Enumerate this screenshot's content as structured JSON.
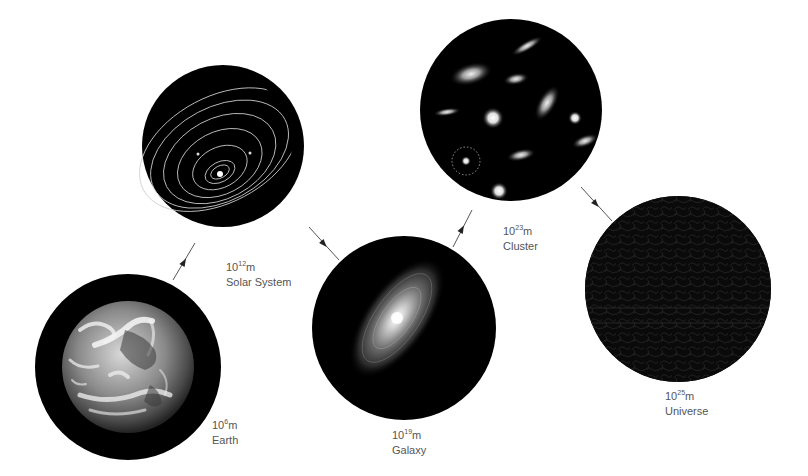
{
  "diagram": {
    "title": "",
    "stages": [
      {
        "id": "earth",
        "base": "10",
        "exponent": "6",
        "unit": "m",
        "name": "Earth",
        "cx": 128,
        "cy": 367,
        "r": 93,
        "label_x": 212,
        "label_y": 418
      },
      {
        "id": "solar-system",
        "base": "10",
        "exponent": "12",
        "unit": "m",
        "name": "Solar System",
        "cx": 223,
        "cy": 146,
        "r": 81,
        "label_x": 226,
        "label_y": 260
      },
      {
        "id": "galaxy",
        "base": "10",
        "exponent": "19",
        "unit": "m",
        "name": "Galaxy",
        "cx": 404,
        "cy": 328,
        "r": 92,
        "label_x": 392,
        "label_y": 428
      },
      {
        "id": "cluster",
        "base": "10",
        "exponent": "23",
        "unit": "m",
        "name": "Cluster",
        "cx": 511,
        "cy": 110,
        "r": 91,
        "label_x": 503,
        "label_y": 224
      },
      {
        "id": "universe",
        "base": "10",
        "exponent": "25",
        "unit": "m",
        "name": "Universe",
        "cx": 678,
        "cy": 289,
        "r": 93,
        "label_x": 665,
        "label_y": 389
      }
    ],
    "arrows": [
      {
        "from": "earth",
        "to": "solar-system",
        "x1": 173,
        "y1": 280,
        "x2": 195,
        "y2": 243
      },
      {
        "from": "solar-system",
        "to": "galaxy",
        "x1": 309,
        "y1": 227,
        "x2": 339,
        "y2": 260
      },
      {
        "from": "galaxy",
        "to": "cluster",
        "x1": 453,
        "y1": 247,
        "x2": 472,
        "y2": 210
      },
      {
        "from": "cluster",
        "to": "universe",
        "x1": 581,
        "y1": 187,
        "x2": 612,
        "y2": 221
      }
    ],
    "colors": {
      "background": "#ffffff",
      "disc": "#000000",
      "arrow": "#555555",
      "label": "#555555"
    }
  }
}
